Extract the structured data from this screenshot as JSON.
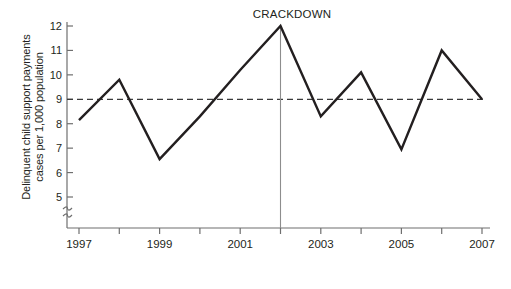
{
  "chart_data": {
    "type": "line",
    "title": "",
    "xlabel": "Year",
    "ylabel": "Delinquent child support payments cases per 1,000 population",
    "ylabel_line1": "Delinquent child support payments",
    "ylabel_line2": "cases per 1,000 population",
    "x": [
      1997,
      1998,
      1999,
      2000,
      2001,
      2002,
      2003,
      2004,
      2005,
      2006,
      2007
    ],
    "values": [
      8.15,
      9.8,
      6.55,
      8.3,
      10.2,
      12.0,
      8.3,
      10.1,
      6.95,
      11.0,
      9.0
    ],
    "series": [
      {
        "name": "Delinquent child support payment cases",
        "values": [
          8.15,
          9.8,
          6.55,
          8.3,
          10.2,
          12.0,
          8.3,
          10.1,
          6.95,
          11.0,
          9.0
        ]
      }
    ],
    "xlim": [
      1997,
      2007
    ],
    "ylim": [
      5,
      12
    ],
    "y_ticks": [
      5,
      6,
      7,
      8,
      9,
      10,
      11,
      12
    ],
    "y_tick_labels": [
      "5",
      "6",
      "7",
      "8",
      "9",
      "10",
      "11",
      "12"
    ],
    "x_ticks": [
      1997,
      1998,
      1999,
      2000,
      2001,
      2002,
      2003,
      2004,
      2005,
      2006,
      2007
    ],
    "x_tick_labels": [
      "1997",
      "",
      "1999",
      "",
      "2001",
      "",
      "2003",
      "",
      "2005",
      "",
      "2007"
    ],
    "x_labeled_ticks": [
      "1997",
      "1999",
      "2001",
      "2003",
      "2005",
      "2007"
    ],
    "grid": false,
    "legend": "none",
    "y_axis_break": true,
    "y_axis_break_symbol": "axis-break-zigzag",
    "reference_line": {
      "label": "",
      "value": 9,
      "orientation": "horizontal",
      "style": "dashed"
    },
    "annotations": [
      {
        "label": "CRACKDOWN",
        "x": 2002,
        "y": 12.0,
        "marker": "vertical-line"
      }
    ],
    "colors": {
      "line": "#231f20",
      "axis": "#6f6f6f",
      "reference_line": "#3a3a3a",
      "annotation_line": "#8d8d8d",
      "background": "#ffffff",
      "text": "#231f20"
    }
  }
}
